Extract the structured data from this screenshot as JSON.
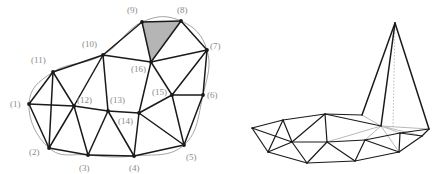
{
  "figure": {
    "colors": {
      "edge": "#1a1a1a",
      "label": "#8a8a8a",
      "boundary_curve": "#9a9a9a",
      "shaded_triangle_fill": "#b5b5b5",
      "hidden_edge": "#b9b9b9",
      "background": "#ffffff"
    },
    "left_panel": {
      "name": "planar-mesh-2d",
      "vertex_labels": [
        {
          "id": 1,
          "text": "(1)",
          "x": 29,
          "y": 104,
          "lx": 10,
          "ly": 107
        },
        {
          "id": 2,
          "text": "(2)",
          "x": 49,
          "y": 148,
          "lx": 29,
          "ly": 155
        },
        {
          "id": 3,
          "text": "(3)",
          "x": 88,
          "y": 155,
          "lx": 79,
          "ly": 171
        },
        {
          "id": 4,
          "text": "(4)",
          "x": 134,
          "y": 156,
          "lx": 129,
          "ly": 171
        },
        {
          "id": 5,
          "text": "(5)",
          "x": 184,
          "y": 145,
          "lx": 186,
          "ly": 160
        },
        {
          "id": 6,
          "text": "(6)",
          "x": 203,
          "y": 95,
          "lx": 207,
          "ly": 98
        },
        {
          "id": 7,
          "text": "(7)",
          "x": 207,
          "y": 50,
          "lx": 210,
          "ly": 49
        },
        {
          "id": 8,
          "text": "(8)",
          "x": 181,
          "y": 21,
          "lx": 177,
          "ly": 13
        },
        {
          "id": 9,
          "text": "(9)",
          "x": 142,
          "y": 22,
          "lx": 127,
          "ly": 13
        },
        {
          "id": 10,
          "text": "(10)",
          "x": 103,
          "y": 55,
          "lx": 82,
          "ly": 47
        },
        {
          "id": 11,
          "text": "(11)",
          "x": 53,
          "y": 72,
          "lx": 31,
          "ly": 63
        },
        {
          "id": 12,
          "text": "(12)",
          "x": 74,
          "y": 106,
          "lx": 77,
          "ly": 103
        },
        {
          "id": 13,
          "text": "(13)",
          "x": 108,
          "y": 111,
          "lx": 110,
          "ly": 103
        },
        {
          "id": 14,
          "text": "(14)",
          "x": 139,
          "y": 113,
          "lx": 118,
          "ly": 124
        },
        {
          "id": 15,
          "text": "(15)",
          "x": 172,
          "y": 95,
          "lx": 152,
          "ly": 95
        },
        {
          "id": 16,
          "text": "(16)",
          "x": 151,
          "y": 62,
          "lx": 131,
          "ly": 72
        }
      ],
      "edges": [
        [
          1,
          2
        ],
        [
          1,
          11
        ],
        [
          1,
          12
        ],
        [
          2,
          3
        ],
        [
          2,
          11
        ],
        [
          2,
          12
        ],
        [
          3,
          4
        ],
        [
          3,
          12
        ],
        [
          3,
          13
        ],
        [
          4,
          5
        ],
        [
          4,
          13
        ],
        [
          4,
          14
        ],
        [
          5,
          6
        ],
        [
          5,
          14
        ],
        [
          5,
          15
        ],
        [
          6,
          7
        ],
        [
          6,
          15
        ],
        [
          7,
          8
        ],
        [
          7,
          15
        ],
        [
          7,
          16
        ],
        [
          8,
          9
        ],
        [
          8,
          16
        ],
        [
          9,
          10
        ],
        [
          9,
          16
        ],
        [
          10,
          11
        ],
        [
          10,
          12
        ],
        [
          10,
          13
        ],
        [
          10,
          16
        ],
        [
          11,
          12
        ],
        [
          12,
          13
        ],
        [
          13,
          14
        ],
        [
          14,
          15
        ],
        [
          14,
          16
        ],
        [
          15,
          16
        ]
      ],
      "shaded_triangle": [
        9,
        8,
        16
      ],
      "boundary_curve": "smooth closed curve through boundary vertices 1,2,3,4,5,6,7,8,9,10,11"
    },
    "right_panel": {
      "name": "lifted-mesh-3d",
      "apex": {
        "x": 395,
        "y": 23
      },
      "dotted_drop_line": {
        "x1": 395,
        "y1": 23,
        "x2": 393,
        "y2": 127
      },
      "vertices": [
        {
          "id": 1,
          "x": 252,
          "y": 128
        },
        {
          "id": 2,
          "x": 268,
          "y": 152
        },
        {
          "id": 3,
          "x": 307,
          "y": 163
        },
        {
          "id": 4,
          "x": 355,
          "y": 161
        },
        {
          "id": 5,
          "x": 399,
          "y": 152
        },
        {
          "id": 6,
          "x": 422,
          "y": 136
        },
        {
          "id": 7,
          "x": 429,
          "y": 129
        },
        {
          "id": 8,
          "x": 395,
          "y": 23
        },
        {
          "id": 9,
          "x": 362,
          "y": 115
        },
        {
          "id": 10,
          "x": 325,
          "y": 114
        },
        {
          "id": 11,
          "x": 283,
          "y": 120
        },
        {
          "id": 12,
          "x": 292,
          "y": 142
        },
        {
          "id": 13,
          "x": 327,
          "y": 142
        },
        {
          "id": 14,
          "x": 365,
          "y": 140
        },
        {
          "id": 15,
          "x": 400,
          "y": 133
        },
        {
          "id": 16,
          "x": 381,
          "y": 126
        }
      ],
      "hidden_edges": [
        [
          9,
          16
        ],
        [
          16,
          15
        ],
        [
          16,
          14
        ],
        [
          16,
          13
        ],
        [
          16,
          5
        ],
        [
          16,
          7
        ],
        [
          16,
          6
        ]
      ]
    }
  }
}
